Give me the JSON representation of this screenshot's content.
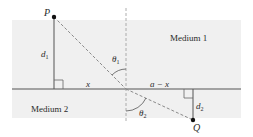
{
  "diagram": {
    "media": [
      {
        "label": "Medium 1",
        "color": "#f0f0f0"
      },
      {
        "label": "Medium 2",
        "color": "#f0f0f0"
      }
    ],
    "points": {
      "P": {
        "label": "P"
      },
      "Q": {
        "label": "Q"
      }
    },
    "distances": {
      "d1": {
        "main": "d",
        "sub": "1"
      },
      "d2": {
        "main": "d",
        "sub": "2"
      },
      "x": "x",
      "a_minus_x": "a − x"
    },
    "angles": {
      "theta1": {
        "main": "θ",
        "sub": "1"
      },
      "theta2": {
        "main": "θ",
        "sub": "2"
      }
    },
    "colors": {
      "line": "#555555",
      "dashed": "#8a8a8a",
      "point": "#111111",
      "shade": "#f0f0f0"
    }
  }
}
